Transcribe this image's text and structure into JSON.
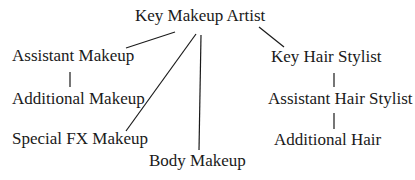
{
  "diagram": {
    "type": "hierarchy",
    "nodes": [
      {
        "id": "key_makeup",
        "label": "Key Makeup Artist",
        "x": 135,
        "y": 6
      },
      {
        "id": "assistant_makeup",
        "label": "Assistant Makeup",
        "x": 12,
        "y": 46
      },
      {
        "id": "additional_makeup",
        "label": "Additional Makeup",
        "x": 12,
        "y": 89
      },
      {
        "id": "special_fx",
        "label": "Special FX Makeup",
        "x": 12,
        "y": 129
      },
      {
        "id": "body_makeup",
        "label": "Body Makeup",
        "x": 149,
        "y": 151
      },
      {
        "id": "key_hair",
        "label": "Key Hair Stylist",
        "x": 271,
        "y": 47
      },
      {
        "id": "assistant_hair",
        "label": "Assistant Hair Stylist",
        "x": 268,
        "y": 89
      },
      {
        "id": "additional_hair",
        "label": "Additional Hair",
        "x": 274,
        "y": 130
      }
    ],
    "edges": [
      {
        "from": "key_makeup",
        "to": "assistant_makeup",
        "x1": 175,
        "y1": 32,
        "x2": 126,
        "y2": 48
      },
      {
        "from": "key_makeup",
        "to": "special_fx",
        "x1": 196,
        "y1": 34,
        "x2": 126,
        "y2": 131
      },
      {
        "from": "key_makeup",
        "to": "body_makeup",
        "x1": 201,
        "y1": 35,
        "x2": 199,
        "y2": 150
      },
      {
        "from": "key_makeup",
        "to": "key_hair",
        "x1": 259,
        "y1": 27,
        "x2": 284,
        "y2": 47
      },
      {
        "from": "assistant_makeup",
        "to": "additional_makeup",
        "x1": 70,
        "y1": 72,
        "x2": 70,
        "y2": 87
      },
      {
        "from": "key_hair",
        "to": "assistant_hair",
        "x1": 334,
        "y1": 73,
        "x2": 334,
        "y2": 87
      },
      {
        "from": "assistant_hair",
        "to": "additional_hair",
        "x1": 334,
        "y1": 113,
        "x2": 334,
        "y2": 129
      }
    ]
  }
}
